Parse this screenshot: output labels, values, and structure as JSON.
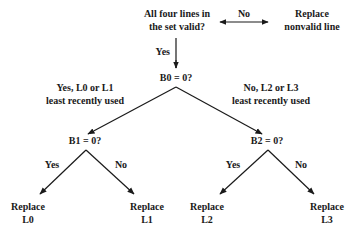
{
  "diagram": {
    "type": "decision-tree",
    "start": {
      "line1": "All four lines in",
      "line2": "the set valid?"
    },
    "no_edge": "No",
    "replace_invalid": {
      "line1": "Replace",
      "line2": "nonvalid line"
    },
    "yes_edge": "Yes",
    "b0": "B0 = 0?",
    "b0_yes": {
      "line1": "Yes, L0 or L1",
      "line2": "least recently used"
    },
    "b0_no": {
      "line1": "No, L2 or L3",
      "line2": "least recently used"
    },
    "b1": "B1 = 0?",
    "b2": "B2 = 0?",
    "b1_yes": "Yes",
    "b1_no": "No",
    "b2_yes": "Yes",
    "b2_no": "No",
    "leaves": [
      {
        "line1": "Replace",
        "line2": "L0"
      },
      {
        "line1": "Replace",
        "line2": "L1"
      },
      {
        "line1": "Replace",
        "line2": "L2"
      },
      {
        "line1": "Replace",
        "line2": "L3"
      }
    ]
  }
}
